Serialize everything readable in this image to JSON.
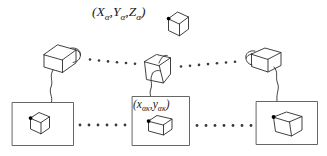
{
  "figure": {
    "stroke_color": "#2b2b2b",
    "marker_color": "#000000",
    "background": "#ffffff",
    "labels": {
      "world_point": {
        "text": "(Xα, Yα, Zα)",
        "open_paren": "(",
        "x_symbol": "X",
        "x_sub": "α",
        "comma1": ",",
        "y_symbol": "Y",
        "y_sub": "α",
        "comma2": ",",
        "z_symbol": "Z",
        "z_sub": "α",
        "close_paren": ")"
      },
      "image_point": {
        "text": "(xακ,yακ)",
        "open_paren": "(",
        "x_symbol": "x",
        "x_sub": "ακ",
        "comma": ",",
        "y_symbol": "y",
        "y_sub": "ακ",
        "close_paren": ")"
      }
    },
    "object": {
      "name": "target-cube",
      "marked_vertex": "black-dot"
    },
    "cameras": [
      {
        "id": "camera-left",
        "orientation": "lens-right"
      },
      {
        "id": "camera-middle",
        "orientation": "lens-front"
      },
      {
        "id": "camera-right",
        "orientation": "lens-left"
      }
    ],
    "image_frames": [
      {
        "id": "image-frame-left",
        "content": "cube-view-left"
      },
      {
        "id": "image-frame-middle",
        "content": "cube-view-middle",
        "label": "(xακ,yακ)"
      },
      {
        "id": "image-frame-right",
        "content": "cube-view-right"
      }
    ],
    "dotted_connectors": [
      {
        "id": "dots-camera-left-to-middle",
        "count": 7
      },
      {
        "id": "dots-camera-middle-to-right",
        "count": 7
      },
      {
        "id": "dots-frame-left-to-middle",
        "count": 7
      },
      {
        "id": "dots-frame-middle-to-right",
        "count": 7
      }
    ],
    "cables": [
      {
        "id": "cable-left"
      },
      {
        "id": "cable-middle"
      },
      {
        "id": "cable-right"
      }
    ]
  }
}
